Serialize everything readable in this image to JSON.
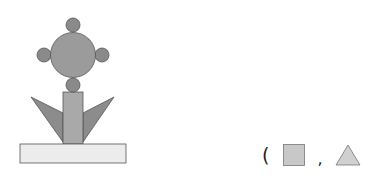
{
  "figure": {
    "colors": {
      "big_circle": "#9b9b9b",
      "small_circle": "#8a8a8a",
      "stem": "#a9a9a9",
      "leaf": "#8c8c8c",
      "base": "#ececec",
      "stroke": "#555555"
    }
  },
  "answer": {
    "open_paren": "(",
    "separator": ",",
    "shapes": [
      {
        "shape": "square",
        "color": "#c8c8c8"
      },
      {
        "shape": "triangle",
        "color": "#d0d0d0"
      }
    ]
  }
}
